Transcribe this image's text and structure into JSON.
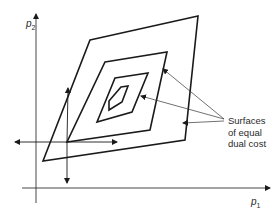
{
  "figure": {
    "axes": {
      "x_label": {
        "symbol": "p",
        "subscript": "1"
      },
      "y_label": {
        "symbol": "p",
        "subscript": "2"
      }
    },
    "annotation": {
      "lines": [
        "Surfaces",
        "of equal",
        "dual cost"
      ]
    },
    "contours": [
      {
        "name": "outer",
        "points": "90,40 198,16 185,140 43,161"
      },
      {
        "name": "second",
        "points": "105,62 167,52 150,130 67,142"
      },
      {
        "name": "third",
        "points": "115,78 148,73 132,112 97,122"
      },
      {
        "name": "inner",
        "points": "120,87 126,86 122,102 109,111 108,102"
      }
    ],
    "colors": {
      "line": "#1a1a1a",
      "thin": "#333333"
    }
  }
}
